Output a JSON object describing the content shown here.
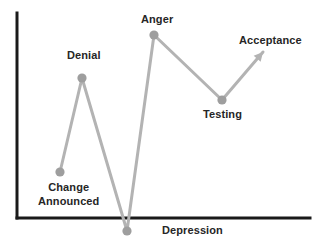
{
  "chart_data": {
    "type": "line",
    "title": "",
    "subtitle": "",
    "xlabel": "",
    "ylabel": "",
    "grid": false,
    "legend": null,
    "axis_color": "#1a1a1a",
    "line_color": "#b3b3b3",
    "marker_color": "#9e9e9e",
    "label_color": "#262626",
    "axes": {
      "x_axis": {
        "x1": 17,
        "y1": 218,
        "x2": 310,
        "y2": 218
      },
      "y_axis": {
        "x1": 17,
        "y1": 13,
        "x2": 17,
        "y2": 218
      },
      "xlim": [
        0,
        7
      ],
      "ylim": [
        -1,
        10
      ]
    },
    "categories": [
      "Change Announced",
      "Denial",
      "Depression",
      "Anger",
      "Testing",
      "Acceptance"
    ],
    "values": [
      2.5,
      7.5,
      -0.7,
      9.8,
      6.3,
      8.7
    ],
    "points": [
      {
        "label": "Change\nAnnounced",
        "label_text": "Change Announced",
        "x": 60,
        "y": 172,
        "morale": 2.5,
        "marker": "circle",
        "label_x": 68,
        "label_y": 180,
        "label_align": "center"
      },
      {
        "label": "Denial",
        "label_text": "Denial",
        "x": 82,
        "y": 78,
        "morale": 7.5,
        "marker": "circle",
        "label_x": 84,
        "label_y": 49,
        "label_align": "center"
      },
      {
        "label": "Depression",
        "label_text": "Depression",
        "x": 127,
        "y": 231,
        "morale": -0.7,
        "marker": "circle",
        "label_x": 192,
        "label_y": 224,
        "label_align": "center"
      },
      {
        "label": "Anger",
        "label_text": "Anger",
        "x": 154,
        "y": 35,
        "morale": 9.8,
        "marker": "circle",
        "label_x": 157,
        "label_y": 13,
        "label_align": "center"
      },
      {
        "label": "Testing",
        "label_text": "Testing",
        "x": 222,
        "y": 100,
        "morale": 6.3,
        "marker": "circle",
        "label_x": 222,
        "label_y": 108,
        "label_align": "center"
      },
      {
        "label": "Acceptance",
        "label_text": "Acceptance",
        "x": 263,
        "y": 52,
        "morale": 8.7,
        "marker": "arrow",
        "label_x": 270,
        "label_y": 34,
        "label_align": "center"
      }
    ],
    "annotations": []
  }
}
